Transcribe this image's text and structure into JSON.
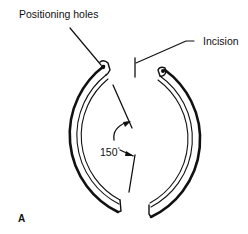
{
  "diagram": {
    "labels": {
      "positioning_holes": "Positioning holes",
      "incision": "Incision",
      "angle_value": "150",
      "angle_unit": "°",
      "panel": "A"
    },
    "colors": {
      "stroke": "#111111",
      "background": "#ffffff"
    }
  }
}
